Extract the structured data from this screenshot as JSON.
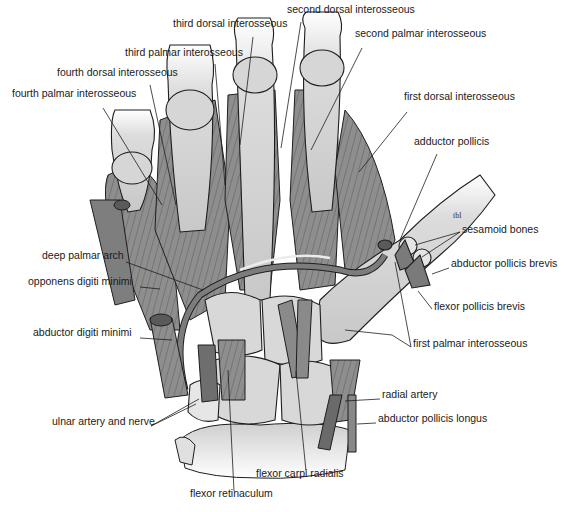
{
  "figure": {
    "signature": "tbl",
    "colors": {
      "bone": "#d9d9d9",
      "bone_shade": "#bdbdbd",
      "muscle": "#8c8c8c",
      "muscle_dark": "#6e6e6e",
      "outline": "#1e1e1e",
      "leader": "#1e1e1e",
      "label_text": "#1a1a1a"
    }
  },
  "labels": [
    {
      "id": "second-dorsal-interosseous",
      "text": "second dorsal interosseous",
      "x": 287,
      "y": 9
    },
    {
      "id": "third-dorsal-interosseous",
      "text": "third dorsal interosseous",
      "x": 173,
      "y": 23
    },
    {
      "id": "second-palmar-interosseous",
      "text": "second palmar interosseous",
      "x": 355,
      "y": 33
    },
    {
      "id": "third-palmar-interosseous",
      "text": "third palmar interosseous",
      "x": 125,
      "y": 52
    },
    {
      "id": "fourth-dorsal-interosseous",
      "text": "fourth dorsal interosseous",
      "x": 57,
      "y": 72
    },
    {
      "id": "fourth-palmar-interosseous",
      "text": "fourth palmar interosseous",
      "x": 12,
      "y": 93
    },
    {
      "id": "first-dorsal-interosseous",
      "text": "first dorsal interosseous",
      "x": 404,
      "y": 96
    },
    {
      "id": "adductor-pollicis",
      "text": "adductor pollicis",
      "x": 414,
      "y": 141
    },
    {
      "id": "sesamoid-bones",
      "text": "sesamoid bones",
      "x": 462,
      "y": 229
    },
    {
      "id": "deep-palmar-arch",
      "text": "deep palmar arch",
      "x": 42,
      "y": 255
    },
    {
      "id": "abductor-pollicis-brevis",
      "text": "abductor pollicis brevis",
      "x": 451,
      "y": 263
    },
    {
      "id": "opponens-digiti-minimi",
      "text": "opponens digiti minimi",
      "x": 28,
      "y": 281
    },
    {
      "id": "flexor-pollicis-brevis",
      "text": "flexor pollicis brevis",
      "x": 434,
      "y": 306
    },
    {
      "id": "abductor-digiti-minimi",
      "text": "abductor digiti minimi",
      "x": 33,
      "y": 332
    },
    {
      "id": "first-palmar-interosseous",
      "text": "first palmar interosseous",
      "x": 413,
      "y": 343
    },
    {
      "id": "radial-artery",
      "text": "radial artery",
      "x": 382,
      "y": 394
    },
    {
      "id": "ulnar-artery-and-nerve",
      "text": "ulnar artery and nerve",
      "x": 52,
      "y": 421
    },
    {
      "id": "abductor-pollicis-longus",
      "text": "abductor pollicis longus",
      "x": 378,
      "y": 418
    },
    {
      "id": "flexor-carpi-radialis",
      "text": "flexor carpi radialis",
      "x": 256,
      "y": 473
    },
    {
      "id": "flexor-retinaculum",
      "text": "flexor retinaculum",
      "x": 190,
      "y": 493
    }
  ],
  "leaders": [
    {
      "id": "second-dorsal-interosseous",
      "points": [
        [
          301,
          22
        ],
        [
          281,
          148
        ]
      ]
    },
    {
      "id": "third-dorsal-interosseous",
      "points": [
        [
          253,
          37
        ],
        [
          240,
          145
        ]
      ]
    },
    {
      "id": "second-palmar-interosseous",
      "points": [
        [
          362,
          48
        ],
        [
          311,
          150
        ]
      ]
    },
    {
      "id": "third-palmar-interosseous",
      "points": [
        [
          215,
          64
        ],
        [
          225,
          185
        ]
      ]
    },
    {
      "id": "fourth-dorsal-interosseous",
      "points": [
        [
          150,
          85
        ],
        [
          176,
          205
        ]
      ]
    },
    {
      "id": "fourth-palmar-interosseous",
      "points": [
        [
          103,
          108
        ],
        [
          162,
          205
        ]
      ]
    },
    {
      "id": "first-dorsal-interosseous",
      "points": [
        [
          407,
          112
        ],
        [
          359,
          172
        ]
      ]
    },
    {
      "id": "adductor-pollicis",
      "points": [
        [
          437,
          154
        ],
        [
          400,
          240
        ]
      ]
    },
    {
      "id": "sesamoid-bones-1",
      "points": [
        [
          460,
          232
        ],
        [
          415,
          245
        ]
      ]
    },
    {
      "id": "sesamoid-bones-2",
      "points": [
        [
          460,
          232
        ],
        [
          422,
          257
        ]
      ]
    },
    {
      "id": "deep-palmar-arch",
      "points": [
        [
          126,
          262
        ],
        [
          203,
          290
        ]
      ]
    },
    {
      "id": "abductor-pollicis-brevis",
      "points": [
        [
          449,
          268
        ],
        [
          432,
          274
        ]
      ]
    },
    {
      "id": "opponens-digiti-minimi",
      "points": [
        [
          140,
          287
        ],
        [
          160,
          289
        ]
      ]
    },
    {
      "id": "flexor-pollicis-brevis",
      "points": [
        [
          432,
          309
        ],
        [
          418,
          291
        ]
      ]
    },
    {
      "id": "abductor-digiti-minimi",
      "points": [
        [
          140,
          338
        ],
        [
          172,
          340
        ]
      ]
    },
    {
      "id": "first-palmar-interosseous-1",
      "points": [
        [
          411,
          347
        ],
        [
          395,
          262
        ]
      ]
    },
    {
      "id": "first-palmar-interosseous-2",
      "points": [
        [
          411,
          347
        ],
        [
          392,
          335
        ],
        [
          345,
          330
        ]
      ]
    },
    {
      "id": "radial-artery",
      "points": [
        [
          380,
          399
        ],
        [
          345,
          401
        ]
      ]
    },
    {
      "id": "ulnar-artery-and-nerve-1",
      "points": [
        [
          151,
          426
        ],
        [
          196,
          404
        ]
      ]
    },
    {
      "id": "ulnar-artery-and-nerve-2",
      "points": [
        [
          151,
          426
        ],
        [
          199,
          399
        ]
      ]
    },
    {
      "id": "abductor-pollicis-longus",
      "points": [
        [
          376,
          423
        ],
        [
          357,
          424
        ]
      ]
    },
    {
      "id": "flexor-carpi-radialis",
      "points": [
        [
          306,
          471
        ],
        [
          296,
          371
        ]
      ]
    },
    {
      "id": "flexor-retinaculum",
      "points": [
        [
          234,
          491
        ],
        [
          228,
          370
        ]
      ]
    }
  ]
}
